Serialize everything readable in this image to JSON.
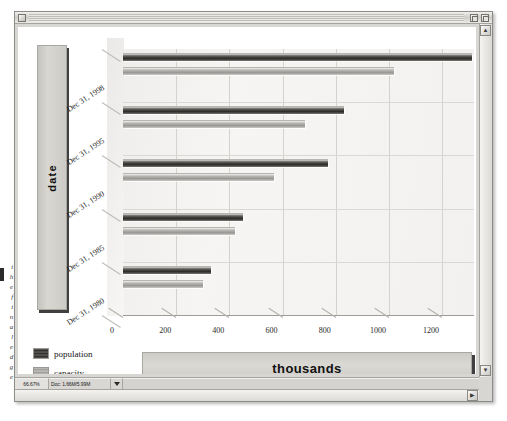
{
  "window": {
    "title": "",
    "close_label": "",
    "zoom_label": "",
    "grow_label": ""
  },
  "statusbar": {
    "zoom_level": "66.67%",
    "doc_size": "Doc: 1.66M/5.99M",
    "popup_label": "",
    "rest": ""
  },
  "scroll": {
    "up_arrow": "▲",
    "down_arrow": "▼",
    "right_arrow": "▶"
  },
  "margin_notes": "t\nh\ne\nf\ni\nn\na\nl\ne\nd\ng\ne",
  "chart_data": {
    "type": "bar",
    "orientation": "horizontal",
    "title": "",
    "xlabel": "thousands",
    "ylabel": "date",
    "categories": [
      "Dec 31, 1998",
      "Dec 31, 1995",
      "Dec 31, 1990",
      "Dec 31, 1985",
      "Dec 31, 1980"
    ],
    "series": [
      {
        "name": "population",
        "values": [
          1313,
          830,
          770,
          453,
          332
        ]
      },
      {
        "name": "capacity",
        "values": [
          1019,
          683,
          566,
          423,
          302
        ]
      }
    ],
    "xlim": [
      0,
      1320
    ],
    "xticks": [
      0,
      200,
      400,
      600,
      800,
      1000,
      1200
    ],
    "xtick_labels": [
      "0",
      "200",
      "400",
      "600",
      "800",
      "1000",
      "1200"
    ],
    "grid": true,
    "legend_position": "bottom-left",
    "legend": [
      "population",
      "capacity"
    ],
    "colors": {
      "population": "#2d2b28",
      "capacity": "#9a9894",
      "plot_background": "#f2f1ef",
      "panel_background": "#d9d7d2",
      "gridline": "#d3d2cf"
    }
  }
}
